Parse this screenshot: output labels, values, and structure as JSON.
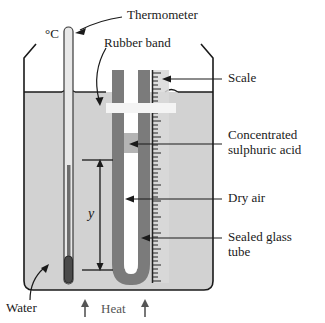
{
  "figure": {
    "labels": {
      "thermometer": "Thermometer",
      "rubber_band": "Rubber band",
      "scale": "Scale",
      "acid_line1": "Concentrated",
      "acid_line2": "sulphuric acid",
      "dry_air": "Dry air",
      "glass_line1": "Sealed glass",
      "glass_line2": "tube",
      "water": "Water",
      "heat": "Heat",
      "celsius": "°C",
      "length_y": "y"
    },
    "arrows": {
      "heat_left": "↑",
      "heat_right": "↑"
    },
    "colors": {
      "outline": "#1a1a1a",
      "water_fill": "#d2d2d2",
      "tube_glass": "#7b7b7b",
      "tube_bore": "#ffffff",
      "acid_plug": "#b4b4b4",
      "rubber_band": "#f2f2f2",
      "scale_strip": "#d9d9d9",
      "mercury": "#6e6e6e",
      "bulb": "#4a4a4a",
      "label_text": "#1a1a1a"
    }
  },
  "geometry": {
    "beaker": {
      "left": 22,
      "right": 215,
      "top_rim": 58,
      "bottom": 292,
      "water_level": 92
    },
    "thermometer": {
      "x": 68,
      "top": 27,
      "bottom": 284,
      "mercury_top": 165,
      "bulb_top": 258
    },
    "utube": {
      "left_limb_x": 112,
      "right_limb_x": 137,
      "top": 70,
      "bend_bottom": 285
    },
    "scale": {
      "x": 152,
      "top": 70,
      "bottom": 283
    },
    "rubber_band": {
      "x1": 108,
      "x2": 174,
      "y1": 103,
      "y2": 113
    },
    "acid": {
      "x1": 126,
      "x2": 137,
      "y1": 133,
      "y2": 152
    },
    "dimension_y": {
      "x": 100,
      "top": 160,
      "bottom": 270
    }
  }
}
